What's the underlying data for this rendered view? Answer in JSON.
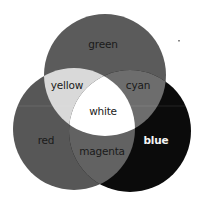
{
  "diagram": {
    "type": "venn",
    "title": "",
    "circles": [
      {
        "id": "green",
        "label": "green",
        "fill": "#5b5b5b",
        "cx": 105,
        "cy": 75,
        "r": 61
      },
      {
        "id": "red",
        "label": "red",
        "fill": "#575757",
        "cx": 74,
        "cy": 129,
        "r": 61
      },
      {
        "id": "blue",
        "label": "blue",
        "fill": "#0b0b0b",
        "cx": 130,
        "cy": 131,
        "r": 61
      }
    ],
    "regions": {
      "green": {
        "label": "green",
        "fill": "#5b5b5b"
      },
      "red": {
        "label": "red",
        "fill": "#575757"
      },
      "blue": {
        "label": "blue",
        "fill": "#0b0b0b"
      },
      "yellow": {
        "label": "yellow",
        "fill": "#d9d9d9"
      },
      "cyan": {
        "label": "cyan",
        "fill": "#6d6d6d"
      },
      "magenta": {
        "label": "magenta",
        "fill": "#626262"
      },
      "white": {
        "label": "white",
        "fill": "#ffffff"
      }
    },
    "labels": {
      "green": "green",
      "yellow": "yellow",
      "cyan": "cyan",
      "white": "white",
      "red": "red",
      "magenta": "magenta",
      "blue": "blue"
    }
  }
}
